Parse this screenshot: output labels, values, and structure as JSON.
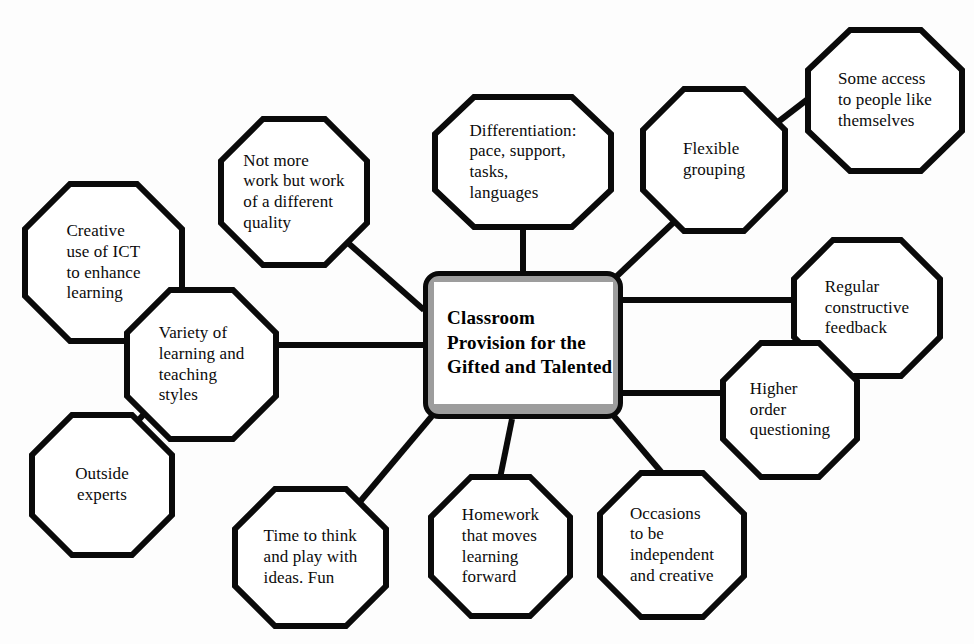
{
  "diagram": {
    "title": "Classroom Provision for the Gifted and Talented",
    "type": "mind-map",
    "background_color": "#fdfdfd",
    "stroke_color": "#0a0a0a",
    "center_band_color": "#9d9d9d"
  },
  "center": {
    "label": "Classroom Provision for the Gifted and Talented",
    "shape": "rounded-rectangle"
  },
  "nodes": [
    {
      "id": "creative-ict",
      "label": "Creative use of ICT to enhance learning",
      "shape": "octagon",
      "align": "left",
      "connects_to": "variety-styles"
    },
    {
      "id": "not-more-work",
      "label": "Not more work but work of a different quality",
      "shape": "octagon",
      "align": "left",
      "connects_to": "center"
    },
    {
      "id": "differentiation",
      "label": "Differentiation: pace, support, tasks, languages",
      "shape": "octagon",
      "align": "left",
      "connects_to": "center"
    },
    {
      "id": "flexible-grouping",
      "label": "Flexible grouping",
      "shape": "octagon",
      "align": "left",
      "connects_to": "center"
    },
    {
      "id": "some-access",
      "label": "Some access to people like themselves",
      "shape": "octagon",
      "align": "left",
      "connects_to": "flexible-grouping"
    },
    {
      "id": "regular-feedback",
      "label": "Regular constructive feedback",
      "shape": "octagon",
      "align": "left",
      "connects_to": "center"
    },
    {
      "id": "higher-order",
      "label": "Higher order questioning",
      "shape": "octagon",
      "align": "left",
      "connects_to": "center"
    },
    {
      "id": "occasions-independent",
      "label": "Occasions to be independent and creative",
      "shape": "octagon",
      "align": "left",
      "connects_to": "center"
    },
    {
      "id": "homework",
      "label": "Homework that moves learning forward",
      "shape": "octagon",
      "align": "left",
      "connects_to": "center"
    },
    {
      "id": "time-to-think",
      "label": "Time to think and play with ideas. Fun",
      "shape": "octagon",
      "align": "left",
      "connects_to": "center"
    },
    {
      "id": "variety-styles",
      "label": "Variety of learning and teaching styles",
      "shape": "octagon",
      "align": "left",
      "connects_to": "center"
    },
    {
      "id": "outside-experts",
      "label": "Outside experts",
      "shape": "octagon",
      "align": "center",
      "connects_to": "variety-styles"
    }
  ],
  "node_text": {
    "creative-ict": "Creative\nuse of ICT\nto enhance\nlearning",
    "not-more-work": "Not more\nwork but work\nof a different\nquality",
    "differentiation": "Differentiation:\npace, support,\ntasks,\nlanguages",
    "flexible-grouping": "Flexible\ngrouping",
    "some-access": "Some access\nto people like\nthemselves",
    "regular-feedback": "Regular\nconstructive\nfeedback",
    "higher-order": "Higher\norder\nquestioning",
    "occasions-independent": "Occasions\nto be\nindependent\nand creative",
    "homework": "Homework\nthat moves\nlearning\nforward",
    "time-to-think": "Time to think\nand play with\nideas. Fun",
    "variety-styles": "Variety of\nlearning and\nteaching\nstyles",
    "outside-experts": "Outside\nexperts"
  }
}
